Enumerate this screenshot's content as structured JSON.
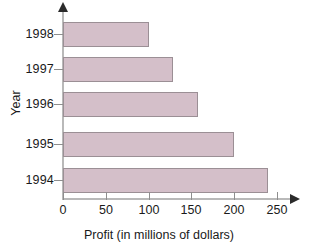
{
  "chart_data": {
    "type": "bar",
    "orientation": "horizontal",
    "title": "",
    "xlabel": "Profit (in millions of dollars)",
    "ylabel": "Year",
    "categories": [
      "1998",
      "1997",
      "1996",
      "1995",
      "1994"
    ],
    "values": [
      100,
      128,
      158,
      200,
      240
    ],
    "xlim": [
      0,
      250
    ],
    "xticks": [
      0,
      50,
      100,
      150,
      200,
      250
    ],
    "xtick_labels": [
      "0",
      "50",
      "100",
      "150",
      "200",
      "250"
    ],
    "grid": false,
    "legend": null,
    "bar_color": "#d4bfc9",
    "bar_border_color": "#9b8f95",
    "axis_color": "#b9b9b9",
    "arrow_color": "#2b2b2b"
  }
}
